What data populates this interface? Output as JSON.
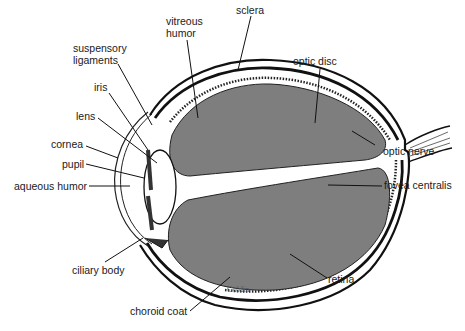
{
  "diagram": {
    "colors": {
      "vitreous_fill": "#7e7e7e",
      "outline": "#111111",
      "background": "#ffffff",
      "label_text": "#1a1a1a"
    },
    "labels": {
      "vitreous_humor": [
        "vitreous",
        "humor"
      ],
      "sclera": "sclera",
      "suspensory_ligaments": [
        "suspensory",
        "ligaments"
      ],
      "optic_disc": "optic disc",
      "iris": "iris",
      "lens": "lens",
      "cornea": "cornea",
      "optic_nerve": "optic nerve",
      "pupil": "pupil",
      "fovea_centralis": "fovea centralis",
      "aqueous_humor": "aqueous humor",
      "ciliary_body": "ciliary body",
      "retina": "retina",
      "choroid_coat": "choroid coat"
    },
    "signature": "Goldin"
  }
}
